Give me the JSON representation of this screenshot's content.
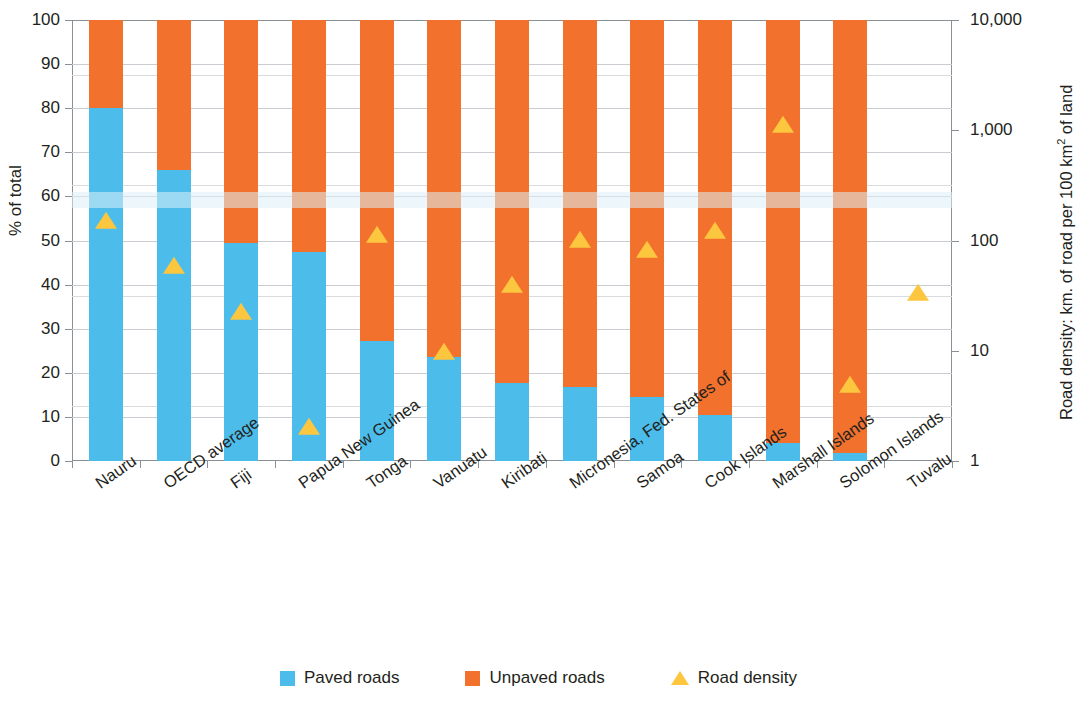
{
  "chart_data": {
    "type": "bar",
    "title": "",
    "subtitle": "",
    "xlabel": "",
    "ylabel": "% of total",
    "ylabel_right": "Road density: km. of road per 100 km² of land",
    "ylim": [
      0,
      100
    ],
    "yticks": [
      0,
      10,
      20,
      30,
      40,
      50,
      60,
      70,
      80,
      90,
      100
    ],
    "y2_scale": "log",
    "y2lim": [
      1,
      10000
    ],
    "y2ticks": [
      "1",
      "10",
      "100",
      "1,000",
      "10,000"
    ],
    "grid": true,
    "legend_position": "bottom",
    "categories": [
      "Nauru",
      "OECD average",
      "Fiji",
      "Papua New Guinea",
      "Tonga",
      "Vanuatu",
      "Kiribati",
      "Micronesia, Fed. States of",
      "Samoa",
      "Cook Islands",
      "Marshall Islands",
      "Solomon Islands",
      "Tuvalu"
    ],
    "series": [
      {
        "name": "Paved roads",
        "type": "bar",
        "color": "#4cbdeb",
        "axis": "left",
        "values": [
          80,
          66,
          49.5,
          47.4,
          27.2,
          23.6,
          17.8,
          16.8,
          14.6,
          10.5,
          4.0,
          1.9,
          null
        ]
      },
      {
        "name": "Unpaved roads",
        "type": "bar",
        "color": "#f1712d",
        "axis": "left",
        "values": [
          20,
          34,
          50.5,
          52.6,
          72.8,
          76.4,
          82.2,
          83.2,
          85.4,
          89.5,
          96.0,
          98.1,
          null
        ]
      },
      {
        "name": "Road density",
        "type": "scatter-marker",
        "marker": "triangle",
        "color": "#fcc63f",
        "axis": "right",
        "values": [
          146,
          57,
          22,
          2.0,
          110,
          9.5,
          39,
          100,
          80,
          120,
          1100,
          4.8,
          33
        ]
      }
    ],
    "legend": [
      {
        "label": "Paved roads",
        "color": "#4cbdeb",
        "marker": "square"
      },
      {
        "label": "Unpaved roads",
        "color": "#f1712d",
        "marker": "square"
      },
      {
        "label": "Road density",
        "color": "#fcc63f",
        "marker": "triangle"
      }
    ]
  },
  "colors": {
    "paved": "#4cbdeb",
    "unpaved": "#f1712d",
    "density": "#fcc63f",
    "axis": "#8a8f94",
    "grid": "#c9cdd1",
    "text": "#231f20"
  }
}
